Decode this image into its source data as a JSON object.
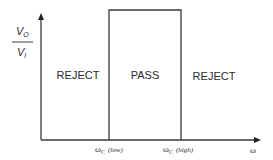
{
  "diagram": {
    "type": "ideal band-pass filter frequency response",
    "y_axis": {
      "label_numerator": "V",
      "label_numerator_sub": "O",
      "label_denominator": "V",
      "label_denominator_sub": "I"
    },
    "x_axis": {
      "label": "ω"
    },
    "cutoffs": {
      "low": {
        "symbol": "ω",
        "sub": "C",
        "qualifier": "(low)"
      },
      "high": {
        "symbol": "ω",
        "sub": "C",
        "qualifier": "(high)"
      }
    },
    "regions": {
      "left": "REJECT",
      "middle": "PASS",
      "right": "REJECT"
    },
    "colors": {
      "line": "#3a3a3a",
      "text": "#2a2a2a",
      "background": "#ffffff"
    }
  }
}
